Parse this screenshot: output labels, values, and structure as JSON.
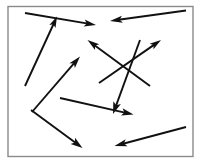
{
  "figure": {
    "canvas": {
      "width": 202,
      "height": 163
    },
    "background_color": "#ffffff",
    "frame": {
      "name": "panel-border",
      "x": 8,
      "y": 6.5,
      "width": 185,
      "height": 150,
      "stroke_color": "#8a8a8a",
      "stroke_width": 1.4,
      "fill_color": "#ffffff"
    },
    "arrow_style": {
      "stroke_color": "#111111",
      "stroke_width": 1.9,
      "head_length": 11,
      "head_half_width": 3.4,
      "head_fill_color": "#111111"
    },
    "arrows": [
      {
        "id": "arrow-top-right-pointing",
        "label": "top arrow pointing right and slightly down",
        "x1": 25,
        "y1": 13,
        "x2": 96,
        "y2": 25,
        "direction": "right-down",
        "head_length": 12,
        "head_half_width": 3.6
      },
      {
        "id": "arrow-left-long-up",
        "label": "long left diagonal arrow pointing up and right",
        "x1": 25,
        "y1": 86,
        "x2": 57,
        "y2": 16.5,
        "direction": "up-right",
        "head_length": 11,
        "head_half_width": 3.4
      },
      {
        "id": "arrow-top-right-left-pointing",
        "label": "upper right arrow pointing left and down",
        "x1": 186,
        "y1": 10.5,
        "x2": 110,
        "y2": 21,
        "direction": "left-down",
        "head_length": 12.5,
        "head_half_width": 3.6
      },
      {
        "id": "arrow-center-up-left",
        "label": "center cluster arrow pointing up and left",
        "x1": 150,
        "y1": 86,
        "x2": 87.5,
        "y2": 40,
        "direction": "up-left",
        "head_length": 12,
        "head_half_width": 3.6
      },
      {
        "id": "arrow-center-up-right",
        "label": "center cluster arrow pointing up and right",
        "x1": 99,
        "y1": 83,
        "x2": 161,
        "y2": 40,
        "direction": "up-right",
        "head_length": 11.5,
        "head_half_width": 3.4
      },
      {
        "id": "arrow-center-steep-down",
        "label": "steep center arrow pointing down and left",
        "x1": 140,
        "y1": 40,
        "x2": 113,
        "y2": 114,
        "direction": "down-left",
        "head_length": 12,
        "head_half_width": 4.0
      },
      {
        "id": "arrow-midleft-up-right",
        "label": "mid left arrow pointing up and right",
        "x1": 32,
        "y1": 112,
        "x2": 80,
        "y2": 56.5,
        "direction": "up-right",
        "head_length": 12,
        "head_half_width": 3.6
      },
      {
        "id": "arrow-mid-right-down",
        "label": "middle arrow pointing right and slightly down",
        "x1": 60,
        "y1": 98,
        "x2": 133.5,
        "y2": 114.5,
        "direction": "right-down",
        "head_length": 12,
        "head_half_width": 3.6
      },
      {
        "id": "arrow-bottomleft-down-right",
        "label": "bottom left arrow pointing down and right",
        "x1": 31,
        "y1": 110,
        "x2": 82.5,
        "y2": 148,
        "direction": "down-right",
        "head_length": 12,
        "head_half_width": 3.8
      },
      {
        "id": "arrow-bottomright-left-pointing",
        "label": "bottom right arrow pointing left and down",
        "x1": 186,
        "y1": 127,
        "x2": 114.5,
        "y2": 146,
        "direction": "left-down",
        "head_length": 12.5,
        "head_half_width": 3.6
      }
    ]
  }
}
